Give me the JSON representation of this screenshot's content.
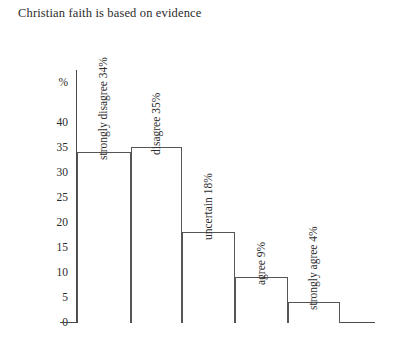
{
  "chart_data": {
    "type": "bar",
    "title": "Christian faith is based on evidence",
    "xlabel": "",
    "ylabel": "%",
    "ylim": [
      0,
      40
    ],
    "yticks": [
      0,
      5,
      10,
      15,
      20,
      25,
      30,
      35,
      40
    ],
    "grid": false,
    "legend": "none",
    "categories": [
      "strongly disagree",
      "disagree",
      "uncertain",
      "agree",
      "strongly agree"
    ],
    "values": [
      34,
      35,
      18,
      9,
      4
    ],
    "bar_labels": [
      "strongly disagree 34%",
      "disagree 35%",
      "uncertain 18%",
      "agree 9%",
      "strongly agree 4%"
    ],
    "colors": {
      "bar_fill": "#ffffff",
      "bar_stroke": "#555555",
      "axis": "#4a4a4a",
      "text": "#2c2c2c",
      "background": "#ffffff"
    }
  }
}
